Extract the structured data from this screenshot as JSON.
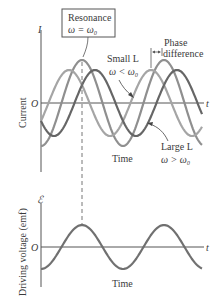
{
  "top_plot": {
    "y_axis_label": "I",
    "side_label": "Current",
    "origin_label": "O",
    "x_axis_label": "t",
    "time_label": "Time",
    "resonance_box": {
      "line1": "Resonance",
      "line2": "ω = ω₀"
    },
    "small_L": {
      "line1": "Small L",
      "line2": "ω < ω₀"
    },
    "large_L": {
      "line1": "Large L",
      "line2": "ω > ω₀"
    },
    "phase": {
      "line1": "Phase",
      "line2": "difference"
    }
  },
  "bottom_plot": {
    "y_axis_label": "ℰ",
    "side_label": "Driving voltage (emf)",
    "origin_label": "O",
    "x_axis_label": "t",
    "time_label": "Time"
  },
  "colors": {
    "axis": "#555555",
    "resonance_curve": "#8f8f8f",
    "small_L_curve": "#a0a0a0",
    "large_L_curve": "#666666",
    "emf_curve": "#707070",
    "text": "#3a3a3a"
  }
}
